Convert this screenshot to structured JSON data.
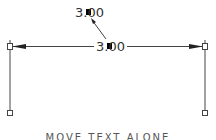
{
  "diagram": {
    "type": "linear-dimension",
    "dimension_text": "3.00",
    "moved_text": "3.00",
    "caption": "MOVE TEXT ALONE",
    "colors": {
      "line": "#333333",
      "background": "#ffffff",
      "grip": "#000000"
    },
    "extension_lines": [
      {
        "x": 10,
        "y_top": 44,
        "y_bottom": 110
      },
      {
        "x": 205,
        "y_top": 44,
        "y_bottom": 110
      }
    ],
    "dimension_line_y": 46,
    "grips": [
      "left-top",
      "right-top",
      "left-bottom",
      "right-bottom",
      "text-grip",
      "moved-text-grip"
    ]
  }
}
